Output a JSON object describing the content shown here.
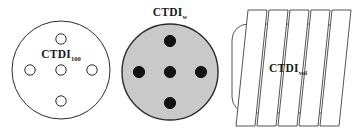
{
  "figure": {
    "background_color": "#ffffff",
    "width": 353,
    "height": 132
  },
  "colors": {
    "outline": "#2b2b2b",
    "outline_light": "#555555",
    "phantom_fill_empty": "#ffffff",
    "phantom_fill_gray": "#c9c9c9",
    "hole_fill_empty": "#ffffff",
    "hole_fill_solid": "#111111",
    "label_text": "#1a1a1a",
    "slice_fill": "#ffffff"
  },
  "panels": [
    {
      "id": "ctdi100",
      "type": "phantom-circle-open",
      "label_main": "CTDI",
      "label_sub": "100",
      "label_x": 61,
      "label_y": 58,
      "center_x": 61,
      "center_y": 70,
      "radius": 49,
      "fill": "#ffffff",
      "stroke": "#2b2b2b",
      "stroke_width": 1,
      "hole_fill": "#ffffff",
      "hole_stroke": "#2b2b2b",
      "hole_radius": 5.2,
      "hole_offset": 31,
      "holes": [
        {
          "name": "center",
          "dx": 0,
          "dy": 0
        },
        {
          "name": "north",
          "dx": 0,
          "dy": -31
        },
        {
          "name": "south",
          "dx": 0,
          "dy": 31
        },
        {
          "name": "east",
          "dx": 31,
          "dy": 0
        },
        {
          "name": "west",
          "dx": -31,
          "dy": 0
        }
      ]
    },
    {
      "id": "ctdiw",
      "type": "phantom-circle-filled",
      "label_main": "CTDI",
      "label_sub": "w",
      "label_x": 170,
      "label_y": 16,
      "center_x": 170,
      "center_y": 72,
      "radius": 48,
      "fill": "#c9c9c9",
      "stroke": "#2b2b2b",
      "stroke_width": 1.4,
      "hole_fill": "#111111",
      "hole_stroke": "#111111",
      "hole_radius": 5.6,
      "hole_offset": 31,
      "holes": [
        {
          "name": "center",
          "dx": 0,
          "dy": 0
        },
        {
          "name": "north",
          "dx": 0,
          "dy": -31
        },
        {
          "name": "south",
          "dx": 0,
          "dy": 31
        },
        {
          "name": "east",
          "dx": 31,
          "dy": 0
        },
        {
          "name": "west",
          "dx": -31,
          "dy": 0
        }
      ]
    },
    {
      "id": "ctdivol",
      "type": "phantom-slices",
      "label_main": "CTDI",
      "label_sub": "vol",
      "label_x": 288,
      "label_y": 72,
      "body_x": 232,
      "body_y": 24,
      "body_width": 108,
      "body_height": 89,
      "body_radius": 16,
      "body_fill": "#ffffff",
      "body_stroke": "#555555",
      "slice_count": 5,
      "slice_fill": "#ffffff",
      "slice_stroke": "#555555",
      "slice_top_y": 10,
      "slice_bottom_y": 126,
      "slice_width": 19,
      "slice_slant": 12,
      "slice_first_bottom_x": 236,
      "slice_spacing": 21
    }
  ]
}
